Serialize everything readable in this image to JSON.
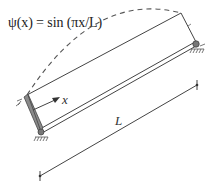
{
  "figure": {
    "equation": "ψ(x) = sin (πx/L)",
    "axis_label": "x",
    "length_label": "L",
    "elements": {
      "beam": "simply-supported beam (pinned both ends)",
      "mode_shape": "dashed half-sine curve",
      "dimension": "length dimension line"
    },
    "colors": {
      "line": "#444444",
      "support_fill": "#8a8a8a",
      "background": "#ffffff"
    }
  }
}
